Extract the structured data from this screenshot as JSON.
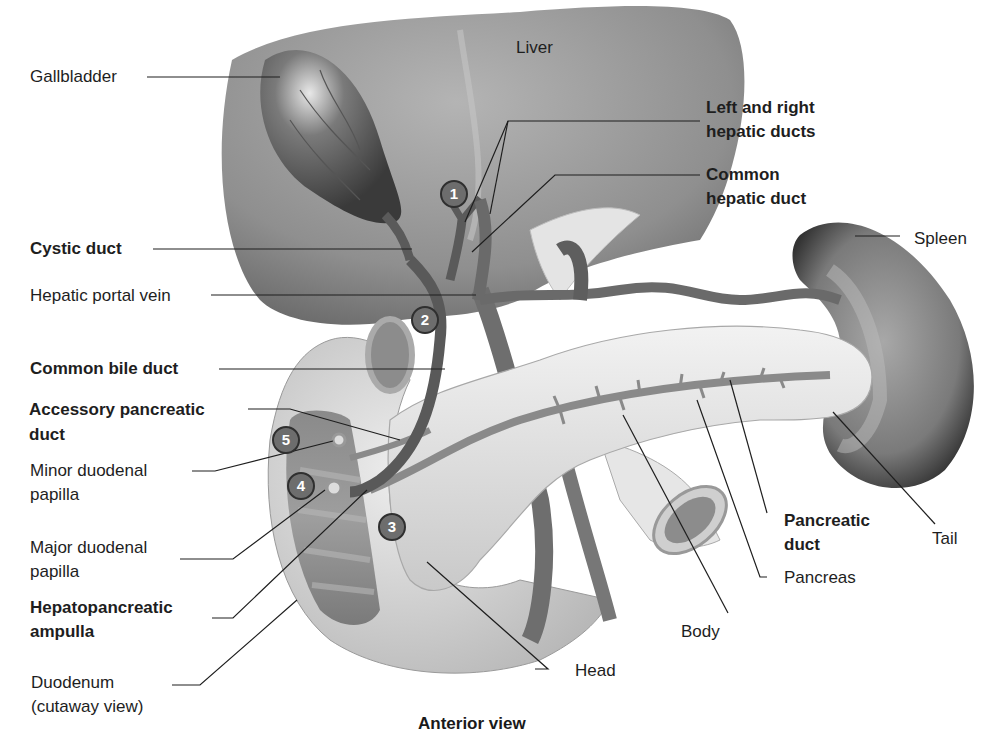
{
  "figure": {
    "caption": "Anterior view",
    "organ_label": "Liver"
  },
  "labels": {
    "gallbladder": {
      "text": "Gallbladder",
      "bold": false
    },
    "left_right_hepatic_1": {
      "text": "Left and right",
      "bold": true
    },
    "left_right_hepatic_2": {
      "text": "hepatic ducts",
      "bold": true
    },
    "common_hepatic_1": {
      "text": "Common",
      "bold": true
    },
    "common_hepatic_2": {
      "text": "hepatic duct",
      "bold": true
    },
    "spleen": {
      "text": "Spleen",
      "bold": false
    },
    "cystic_duct": {
      "text": "Cystic duct",
      "bold": true
    },
    "hepatic_portal_vein": {
      "text": "Hepatic portal vein",
      "bold": false
    },
    "common_bile_duct": {
      "text": "Common bile duct",
      "bold": true
    },
    "accessory_pancreatic_1": {
      "text": "Accessory pancreatic",
      "bold": true
    },
    "accessory_pancreatic_2": {
      "text": "duct",
      "bold": true
    },
    "minor_papilla_1": {
      "text": "Minor duodenal",
      "bold": false
    },
    "minor_papilla_2": {
      "text": "papilla",
      "bold": false
    },
    "major_papilla_1": {
      "text": "Major duodenal",
      "bold": false
    },
    "major_papilla_2": {
      "text": "papilla",
      "bold": false
    },
    "ampulla_1": {
      "text": "Hepatopancreatic",
      "bold": true
    },
    "ampulla_2": {
      "text": "ampulla",
      "bold": true
    },
    "duodenum_1": {
      "text": "Duodenum",
      "bold": false
    },
    "duodenum_2": {
      "text": "(cutaway view)",
      "bold": false
    },
    "pancreatic_duct_1": {
      "text": "Pancreatic",
      "bold": true
    },
    "pancreatic_duct_2": {
      "text": "duct",
      "bold": true
    },
    "tail": {
      "text": "Tail",
      "bold": false
    },
    "pancreas": {
      "text": "Pancreas",
      "bold": false
    },
    "body": {
      "text": "Body",
      "bold": false
    },
    "head": {
      "text": "Head",
      "bold": false
    }
  },
  "markers": [
    "1",
    "2",
    "3",
    "4",
    "5"
  ]
}
